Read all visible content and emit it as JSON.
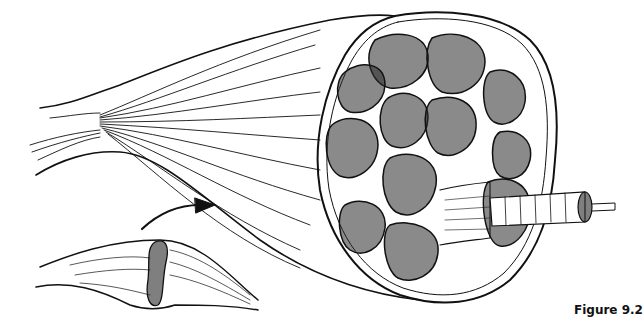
{
  "figure": {
    "caption": "Figure 9.2",
    "colors": {
      "ink": "#111111",
      "paper": "#ffffff"
    },
    "parts": {
      "muscle_belly": "large muscle tapering to tendon at left",
      "cross_section": "fascicles in cross-section",
      "fascicle": "extracted fascicle bundle",
      "fiber": "single muscle fiber with myofibril",
      "inset_muscle": "small whole muscle with cut band",
      "arrow": "curved arrow from inset to enlarged view"
    }
  }
}
